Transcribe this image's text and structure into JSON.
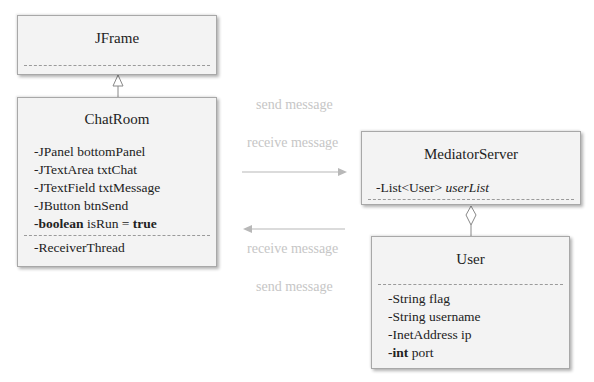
{
  "diagram": {
    "type": "UML class diagram",
    "classes": {
      "jframe": {
        "name": "JFrame",
        "attributes": []
      },
      "chatroom": {
        "name": "ChatRoom",
        "attributes": [
          {
            "prefix": "-",
            "type": "JPanel",
            "name": "bottomPanel",
            "type_bold": false
          },
          {
            "prefix": "-",
            "type": "JTextArea",
            "name": "txtChat",
            "type_bold": false
          },
          {
            "prefix": "-",
            "type": "JTextField",
            "name": "txtMessage",
            "type_bold": false
          },
          {
            "prefix": "-",
            "type": "JButton",
            "name": "btnSend",
            "type_bold": false
          },
          {
            "prefix": "-",
            "type": "boolean",
            "name": "isRun",
            "assign": "=",
            "value": "true",
            "type_bold": true
          }
        ],
        "operations": [
          {
            "label": "-ReceiverThread"
          }
        ]
      },
      "mediator": {
        "name": "MediatorServer",
        "attributes": [
          {
            "prefix": "-",
            "type": "List<User>",
            "name": "userList",
            "name_italic": true
          }
        ]
      },
      "user": {
        "name": "User",
        "attributes": [
          {
            "prefix": "-",
            "type": "String",
            "name": "flag"
          },
          {
            "prefix": "-",
            "type": "String",
            "name": "username"
          },
          {
            "prefix": "-",
            "type": "InetAddress",
            "name": "ip"
          },
          {
            "prefix": "-",
            "type": "int",
            "name": "port",
            "type_bold": true
          }
        ]
      }
    },
    "relations": [
      {
        "kind": "generalization",
        "from": "ChatRoom",
        "to": "JFrame"
      },
      {
        "kind": "aggregation",
        "whole": "MediatorServer",
        "part": "User"
      },
      {
        "kind": "message",
        "direction": "ChatRoom -> MediatorServer"
      },
      {
        "kind": "message",
        "direction": "MediatorServer -> ChatRoom"
      }
    ],
    "labels": {
      "top_send": "send message",
      "top_receive": "receive message",
      "bottom_receive": "receive message",
      "bottom_send": "send message"
    },
    "colors": {
      "box_fill": "#f3f3f3",
      "box_border": "#a8a8a8",
      "label_gray": "#c6c6c6",
      "arrow_gray": "#b8b8b8",
      "text": "#222222"
    }
  }
}
